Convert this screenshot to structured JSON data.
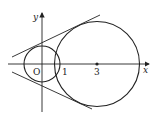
{
  "diagram": {
    "type": "geometry",
    "axes": {
      "x_label": "x",
      "y_label": "y",
      "origin_label": "O"
    },
    "tick_labels": {
      "one": "1",
      "three": "3"
    },
    "circles": [
      {
        "name": "small-circle",
        "center": [
          0,
          0
        ],
        "radius": 1
      },
      {
        "name": "large-circle",
        "center": [
          3,
          0
        ],
        "radius": 2.3
      }
    ],
    "points": [
      {
        "name": "large-circle-center",
        "coords": [
          3,
          0
        ]
      }
    ],
    "lines": [
      {
        "name": "upper-tangent-line"
      },
      {
        "name": "lower-tangent-line"
      }
    ],
    "colors": {
      "stroke": "#222222",
      "background": "#ffffff"
    }
  }
}
